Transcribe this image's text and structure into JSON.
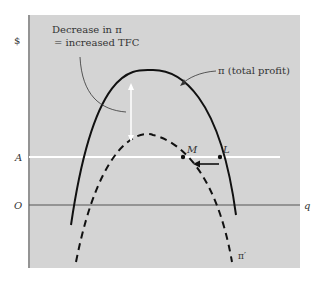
{
  "diagram": {
    "type": "economics profit curve diagram",
    "y_axis_label": "$",
    "x_axis_label": "q",
    "origin_label": "O",
    "horizontal_line_label": "A",
    "curves": [
      {
        "id": "pi",
        "label": "π (total profit)",
        "style": "solid"
      },
      {
        "id": "pi_prime",
        "label": "π′",
        "style": "dashed"
      }
    ],
    "points": [
      {
        "label": "L",
        "on": "π"
      },
      {
        "label": "M",
        "on": "π′"
      }
    ],
    "annotation": {
      "line1": "Decrease in π",
      "line2": "= increased TFC"
    },
    "colors": {
      "panel": "#d4d4d4",
      "curve": "#111111",
      "highlight_line": "#ffffff",
      "axis": "#444444"
    }
  }
}
